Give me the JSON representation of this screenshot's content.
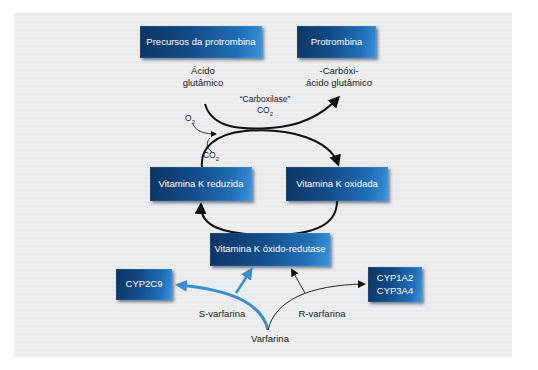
{
  "diagram": {
    "boxes": {
      "precursos": "Precursos da protrombina",
      "protrombina": "Protrombina",
      "vk_reduzida": "Vitamina K reduzida",
      "vk_oxidada": "Vitamina K oxidada",
      "vk_redutase": "Vitamina K óxido-redutase",
      "cyp2c9": "CYP2C9",
      "cyp1a2_cyp3a4": "CYP1A2\nCYP3A4"
    },
    "labels": {
      "acido_glutamico": "Ácido\nglutâmico",
      "carboxi_acido": "-Carbóxi-\nácido glutâmico",
      "carboxilase": "“Carboxilase”",
      "co2_top": "CO",
      "co2_top_sub": "2",
      "o2": "O",
      "o2_sub": "2",
      "co2_mid": "CO",
      "co2_mid_sub": "2",
      "s_varfarina": "S-varfarina",
      "r_varfarina": "R-varfarina",
      "varfarina": "Varfarina"
    },
    "colors": {
      "box_dark": "#0b3563",
      "box_light": "#3a95dd",
      "arrow_black": "#111111",
      "arrow_blue": "#3a8fd0",
      "panel": "#eaebed"
    }
  }
}
